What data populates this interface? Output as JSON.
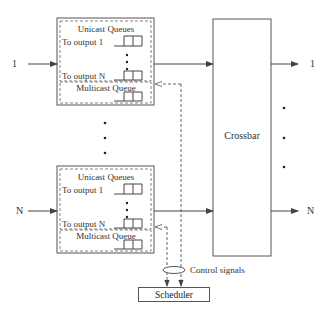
{
  "diagram": {
    "type": "input-queued switch architecture",
    "inputs": [
      {
        "label": "1"
      },
      {
        "label": "N"
      }
    ],
    "outputs": [
      {
        "label": "1"
      },
      {
        "label": "N"
      }
    ],
    "input_modules": [
      {
        "id": "input-1",
        "unicast_title": "Unicast Queues",
        "queue_labels": [
          "To output 1",
          "To output N"
        ],
        "multicast_title": "Multicast Queue"
      },
      {
        "id": "input-N",
        "unicast_title": "Unicast Queues",
        "queue_labels": [
          "To output 1",
          "To output N"
        ],
        "multicast_title": "Multicast Queue"
      }
    ],
    "crossbar_label": "Crossbar",
    "control_label": "Control signals",
    "scheduler_label": "Scheduler",
    "edges": [
      {
        "from": "input 1",
        "to": "input-1 module",
        "style": "solid"
      },
      {
        "from": "input N",
        "to": "input-N module",
        "style": "solid"
      },
      {
        "from": "input-1 module",
        "to": "Crossbar",
        "style": "solid"
      },
      {
        "from": "input-N module",
        "to": "Crossbar",
        "style": "solid"
      },
      {
        "from": "Crossbar",
        "to": "output 1",
        "style": "solid"
      },
      {
        "from": "Crossbar",
        "to": "output N",
        "style": "solid"
      },
      {
        "from": "input-1 module",
        "to": "Scheduler",
        "style": "dashed",
        "label": "Control signals"
      },
      {
        "from": "input-N module",
        "to": "Scheduler",
        "style": "dashed",
        "label": "Control signals"
      }
    ]
  }
}
